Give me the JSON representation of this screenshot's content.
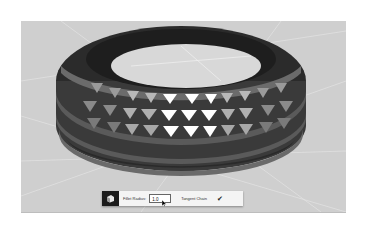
{
  "viewport": {
    "background": "#cfcfcf",
    "object": "studded-ring-3d-model"
  },
  "toolbar": {
    "tool_icon": "fillet-tool-icon",
    "fillet_radius_label": "Fillet Radius:",
    "fillet_radius_value": "1.0",
    "tangent_chain_label": "Tangent Chain",
    "tangent_chain_checked": true,
    "checkbox_glyph": "✔"
  },
  "colors": {
    "toolbar_bg": "#f4f4f4",
    "tool_icon_bg": "#1c1c1c",
    "ring_dark": "#2b2b2b",
    "ring_mid": "#555555",
    "stud_light": "#ffffff"
  }
}
